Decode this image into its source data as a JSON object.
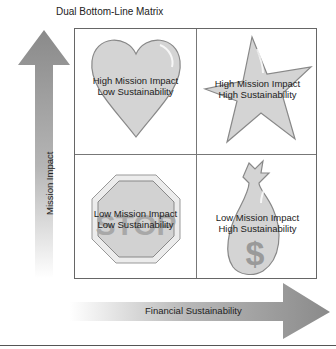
{
  "title": "Dual Bottom-Line Matrix",
  "axes": {
    "y_label": "Mission Impact",
    "x_label": "Financial Sustainability"
  },
  "quadrants": [
    {
      "position": "top-left",
      "icon": "heart-icon",
      "line1": "High Mission Impact",
      "line2": "Low Sustainability"
    },
    {
      "position": "top-right",
      "icon": "star-icon",
      "line1": "High Mission Impact",
      "line2": "High Sustainability"
    },
    {
      "position": "bottom-left",
      "icon": "stop-sign-icon",
      "line1": "Low Mission Impact",
      "line2": "Low Sustainability",
      "sign_text": "STOP"
    },
    {
      "position": "bottom-right",
      "icon": "money-bag-icon",
      "line1": "Low Mission Impact",
      "line2": "High Sustainability",
      "bag_symbol": "$"
    }
  ],
  "colors": {
    "arrow_dark": "#8a8a8a",
    "shape_fill": "#d4d4d4",
    "shape_stroke": "#888888",
    "border": "#666666"
  }
}
